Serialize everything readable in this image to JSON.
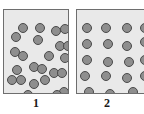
{
  "figure": {
    "name": "two-box-particle-distribution-diagram",
    "width": 144,
    "height": 114,
    "background_color": "#ffffff",
    "panel_fill_color": "#e9e9e9",
    "panel_border_color": "#6e6e6e",
    "particle_fill_color": "#8e8e8e",
    "particle_border_color": "#4a4a4a",
    "label_color": "#1a1a1a"
  },
  "panels": [
    {
      "label": "1",
      "x": 3,
      "y": 9,
      "width": 66,
      "height": 85,
      "label_x": 3,
      "label_y": 96,
      "label_width": 66,
      "particle_count": 24,
      "particle_diameter": 10,
      "arrangement": "random-clustered",
      "particles": [
        {
          "cx": 19,
          "cy": 18
        },
        {
          "cx": 12,
          "cy": 27
        },
        {
          "cx": 36,
          "cy": 18
        },
        {
          "cx": 52,
          "cy": 21
        },
        {
          "cx": 61,
          "cy": 19
        },
        {
          "cx": 34,
          "cy": 30
        },
        {
          "cx": 56,
          "cy": 36
        },
        {
          "cx": 64,
          "cy": 36
        },
        {
          "cx": 11,
          "cy": 42
        },
        {
          "cx": 19,
          "cy": 46
        },
        {
          "cx": 45,
          "cy": 46
        },
        {
          "cx": 61,
          "cy": 48
        },
        {
          "cx": 30,
          "cy": 57
        },
        {
          "cx": 38,
          "cy": 59
        },
        {
          "cx": 50,
          "cy": 63
        },
        {
          "cx": 58,
          "cy": 63
        },
        {
          "cx": 8,
          "cy": 70
        },
        {
          "cx": 17,
          "cy": 70
        },
        {
          "cx": 30,
          "cy": 74
        },
        {
          "cx": 41,
          "cy": 70
        },
        {
          "cx": 60,
          "cy": 82
        },
        {
          "cx": 53,
          "cy": 85
        },
        {
          "cx": 24,
          "cy": 85
        },
        {
          "cx": 13,
          "cy": 60
        }
      ]
    },
    {
      "label": "2",
      "x": 76,
      "y": 9,
      "width": 70,
      "height": 85,
      "label_x": 76,
      "label_y": 96,
      "label_width": 62,
      "particle_count": 19,
      "particle_diameter": 10,
      "arrangement": "evenly-spaced",
      "particles": [
        {
          "cx": 10,
          "cy": 18
        },
        {
          "cx": 29,
          "cy": 18
        },
        {
          "cx": 50,
          "cy": 18
        },
        {
          "cx": 68,
          "cy": 18
        },
        {
          "cx": 10,
          "cy": 34
        },
        {
          "cx": 31,
          "cy": 34
        },
        {
          "cx": 50,
          "cy": 36
        },
        {
          "cx": 68,
          "cy": 32
        },
        {
          "cx": 10,
          "cy": 50
        },
        {
          "cx": 31,
          "cy": 52
        },
        {
          "cx": 52,
          "cy": 52
        },
        {
          "cx": 68,
          "cy": 50
        },
        {
          "cx": 8,
          "cy": 66
        },
        {
          "cx": 29,
          "cy": 66
        },
        {
          "cx": 50,
          "cy": 68
        },
        {
          "cx": 68,
          "cy": 66
        },
        {
          "cx": 12,
          "cy": 82
        },
        {
          "cx": 33,
          "cy": 84
        },
        {
          "cx": 56,
          "cy": 82
        }
      ]
    }
  ]
}
